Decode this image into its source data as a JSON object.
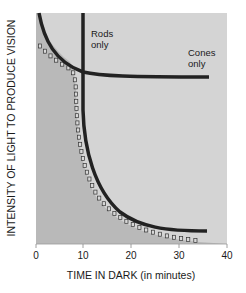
{
  "chart_data": {
    "type": "line",
    "title": "",
    "xlabel": "TIME IN DARK (in minutes)",
    "ylabel": "INTENSITY OF LIGHT TO PRODUCE VISION",
    "xlim": [
      0,
      40
    ],
    "xticks": [
      0,
      10,
      20,
      30,
      40
    ],
    "xtick_labels": [
      "0",
      "10",
      "20",
      "30",
      "40"
    ],
    "ylim": "unlabeled (relative intensity, high at top)",
    "grid": false,
    "legend": "none (inline annotations)",
    "annotations": [
      {
        "text_line1": "Rods",
        "text_line2": "only",
        "near_x": 10
      },
      {
        "text_line1": "Cones",
        "text_line2": "only",
        "near_x": 33
      }
    ],
    "series": [
      {
        "name": "Cones only",
        "style": "solid dark thick",
        "x": [
          0.2,
          2,
          4,
          6,
          8,
          10,
          15,
          20,
          25,
          30,
          36
        ],
        "y_relative": [
          1.0,
          0.88,
          0.8,
          0.76,
          0.745,
          0.74,
          0.73,
          0.725,
          0.725,
          0.725,
          0.725
        ]
      },
      {
        "name": "Rods only",
        "style": "solid dark thick",
        "x": [
          10,
          10.1,
          10.5,
          11,
          12,
          14,
          17,
          20,
          25,
          30,
          36
        ],
        "y_relative": [
          1.0,
          0.8,
          0.6,
          0.45,
          0.32,
          0.2,
          0.12,
          0.08,
          0.06,
          0.055,
          0.055
        ]
      },
      {
        "name": "Combined dark adaptation threshold",
        "style": "dotted (open squares)",
        "x": [
          1,
          3,
          5,
          7,
          8,
          8.5,
          9,
          10,
          12,
          15,
          20,
          25,
          30,
          34
        ],
        "y_relative": [
          0.86,
          0.82,
          0.78,
          0.75,
          0.7,
          0.55,
          0.4,
          0.3,
          0.2,
          0.12,
          0.06,
          0.03,
          0.015,
          0.01
        ]
      }
    ],
    "colors": {
      "plot_background": "#d4d4d4",
      "shaded_region": "#b9b9b9",
      "curve": "#222222",
      "marker": "#333333",
      "text": "#1a1a1a"
    }
  }
}
